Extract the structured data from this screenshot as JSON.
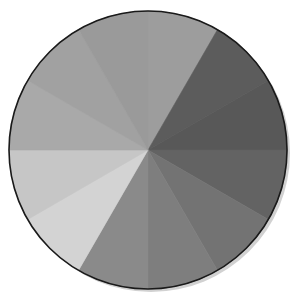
{
  "figure": {
    "segment_count": 12,
    "segments": [
      {
        "index": 0,
        "from_deg": 0,
        "to_deg": 30,
        "color": "#9d9d9d"
      },
      {
        "index": 1,
        "from_deg": 30,
        "to_deg": 60,
        "color": "#5c5c5c"
      },
      {
        "index": 2,
        "from_deg": 60,
        "to_deg": 90,
        "color": "#585858"
      },
      {
        "index": 3,
        "from_deg": 90,
        "to_deg": 120,
        "color": "#636363"
      },
      {
        "index": 4,
        "from_deg": 120,
        "to_deg": 150,
        "color": "#737373"
      },
      {
        "index": 5,
        "from_deg": 150,
        "to_deg": 180,
        "color": "#7e7e7e"
      },
      {
        "index": 6,
        "from_deg": 180,
        "to_deg": 210,
        "color": "#8a8a8a"
      },
      {
        "index": 7,
        "from_deg": 210,
        "to_deg": 240,
        "color": "#d3d3d3"
      },
      {
        "index": 8,
        "from_deg": 240,
        "to_deg": 270,
        "color": "#c6c6c6"
      },
      {
        "index": 9,
        "from_deg": 270,
        "to_deg": 300,
        "color": "#a9a9a9"
      },
      {
        "index": 10,
        "from_deg": 300,
        "to_deg": 330,
        "color": "#a1a1a1"
      },
      {
        "index": 11,
        "from_deg": 330,
        "to_deg": 360,
        "color": "#9a9a9a"
      }
    ],
    "outline_color": "#1a1a1a",
    "shadow_color": "#bdbdbd",
    "background_color": "#ffffff"
  }
}
